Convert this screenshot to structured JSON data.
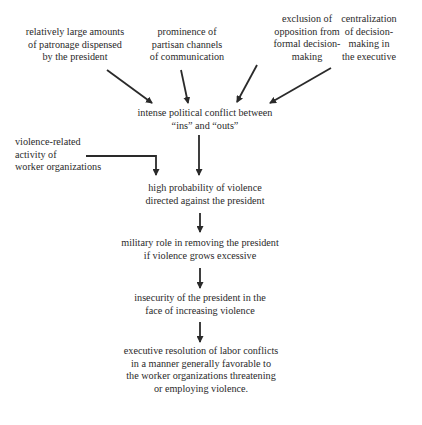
{
  "diagram": {
    "causes": [
      {
        "id": "patronage",
        "lines": [
          "relatively large amounts",
          "of patronage dispensed",
          "by the president"
        ]
      },
      {
        "id": "partisan-channels",
        "lines": [
          "prominence of",
          "partisan channels",
          "of communication"
        ]
      },
      {
        "id": "exclusion",
        "lines": [
          "exclusion of",
          "opposition from",
          "formal decision-",
          "making"
        ]
      },
      {
        "id": "centralization",
        "lines": [
          "centralization",
          "of decision-",
          "making in",
          "the executive"
        ]
      }
    ],
    "conflict": {
      "lines": [
        "intense political conflict between",
        "“ins” and “outs”"
      ]
    },
    "worker_activity": {
      "lines": [
        "violence-related",
        "activity of",
        "worker organizations"
      ]
    },
    "violence": {
      "lines": [
        "high probability of violence",
        "directed against the president"
      ]
    },
    "military": {
      "lines": [
        "military role in removing the president",
        "if violence grows excessive"
      ]
    },
    "insecurity": {
      "lines": [
        "insecurity of the president in the",
        "face of increasing violence"
      ]
    },
    "outcome": {
      "lines": [
        "executive resolution of labor conflicts",
        "in a manner generally favorable to",
        "the worker organizations threatening",
        "or employing violence."
      ]
    },
    "edges": [
      {
        "from": "patronage",
        "to": "conflict"
      },
      {
        "from": "partisan-channels",
        "to": "conflict"
      },
      {
        "from": "exclusion",
        "to": "conflict"
      },
      {
        "from": "centralization",
        "to": "conflict"
      },
      {
        "from": "conflict",
        "to": "violence"
      },
      {
        "from": "worker_activity",
        "to": "violence"
      },
      {
        "from": "violence",
        "to": "military"
      },
      {
        "from": "military",
        "to": "insecurity"
      },
      {
        "from": "insecurity",
        "to": "outcome"
      }
    ]
  }
}
